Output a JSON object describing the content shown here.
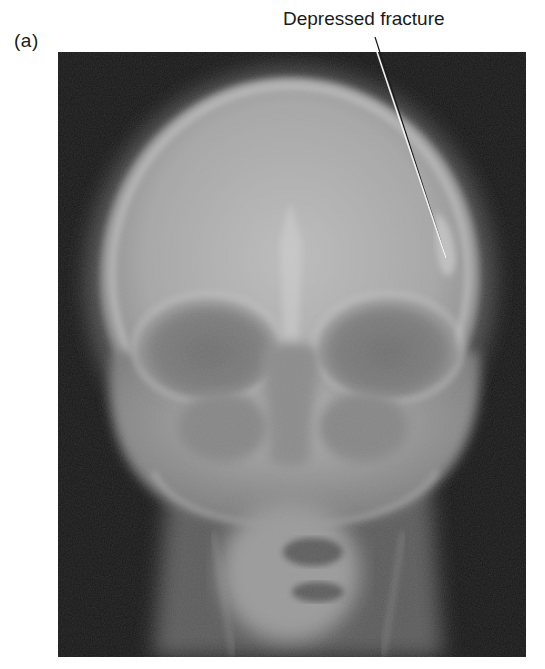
{
  "figure": {
    "panel_label": "(a)",
    "image_description": "Frontal (AP) skull radiograph",
    "annotations": [
      {
        "label": "Depressed fracture",
        "leader_line": {
          "x1": 375,
          "y1": 37,
          "x2": 446,
          "y2": 258
        }
      }
    ]
  },
  "colors": {
    "film_background": "#161616",
    "bone_highlight": "#d8d8d8",
    "text": "#1a1a1a",
    "leader_line": "#f2f2f2"
  }
}
